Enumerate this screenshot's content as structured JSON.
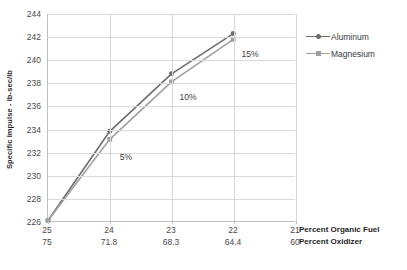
{
  "chart_data": {
    "type": "line",
    "title": "",
    "subtitle": "",
    "ylabel": "Specific Impulse - lb-sec/lb",
    "xlabel": "",
    "ylim": [
      226,
      244
    ],
    "ytick_step": 2,
    "yticks": [
      226,
      228,
      230,
      232,
      234,
      236,
      238,
      240,
      242,
      244
    ],
    "grid": true,
    "legend_position": "right",
    "x_axis_rows": [
      {
        "title": "Percent Organic Fuel",
        "values": [
          "25",
          "24",
          "23",
          "22",
          "21"
        ]
      },
      {
        "title": "Percent Oxidizer",
        "values": [
          "75",
          "71.8",
          "68.3",
          "64.4",
          "60"
        ]
      }
    ],
    "categories": [
      "25",
      "24",
      "23",
      "22"
    ],
    "series": [
      {
        "name": "Aluminum",
        "marker": "diamond",
        "color": "#6d6d6d",
        "values": [
          226.05,
          233.8,
          238.8,
          242.3
        ]
      },
      {
        "name": "Magnesium",
        "marker": "square",
        "color": "#a0a0a0",
        "values": [
          226.05,
          233.1,
          238.1,
          241.8
        ]
      }
    ],
    "annotations": [
      {
        "text": "5%",
        "x_category": "24",
        "y_value": 231.6
      },
      {
        "text": "10%",
        "x_category": "23",
        "y_value": 236.8
      },
      {
        "text": "15%",
        "x_category": "22",
        "y_value": 240.5
      }
    ]
  },
  "legend": {
    "items": [
      {
        "label": "Aluminum"
      },
      {
        "label": "Magnesium"
      }
    ]
  },
  "colors": {
    "aluminum": "#6d6d6d",
    "magnesium": "#a0a0a0",
    "gridline": "#d9d9d9",
    "axis": "#bfbfbf",
    "tick_text": "#4a4a4a",
    "title_text": "#1f1f1f"
  }
}
